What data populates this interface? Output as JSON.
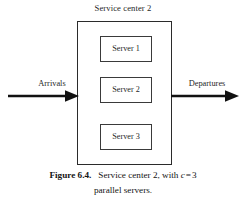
{
  "figure": {
    "center_title": "Service center 2",
    "servers": [
      {
        "label": "Server 1"
      },
      {
        "label": "Server 2"
      },
      {
        "label": "Server 3"
      }
    ],
    "flows": {
      "inbound_label": "Arrivals",
      "outbound_label": "Departures"
    },
    "caption": {
      "number_label": "Figure 6.4.",
      "text_before_var": "Service center 2, with",
      "variable": "c",
      "operator": "=",
      "value": "3",
      "line_two": "parallel servers."
    },
    "colors": {
      "background": "#ffffff",
      "outer_border": "#2b2b2b",
      "inner_border": "#3a3a3a",
      "arrow": "#111111",
      "text": "#1f1f1f"
    }
  }
}
